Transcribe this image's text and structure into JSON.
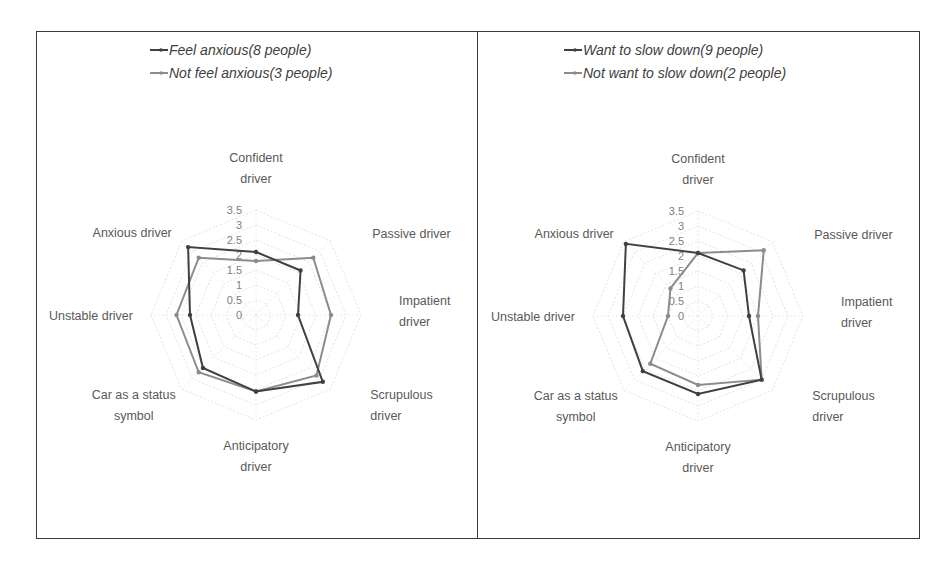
{
  "chart_data": [
    {
      "type": "radar",
      "title": "",
      "categories": [
        "Confident driver",
        "Passive driver",
        "Impatient driver",
        "Scrupulous driver",
        "Anticipatory driver",
        "Car as a status symbol",
        "Unstable driver",
        "Anxious driver"
      ],
      "category_lines": [
        [
          "Confident",
          "driver"
        ],
        [
          "Passive driver"
        ],
        [
          "Impatient",
          "driver"
        ],
        [
          "Scrupulous",
          "driver"
        ],
        [
          "Anticipatory",
          "driver"
        ],
        [
          "Car as a status",
          "symbol"
        ],
        [
          "Unstable driver"
        ],
        [
          "Anxious driver"
        ]
      ],
      "rlim": [
        0,
        3.5
      ],
      "ticks": [
        "0",
        "0.5",
        "1",
        "1.5",
        "2",
        "2.5",
        "3",
        "3.5"
      ],
      "grid": true,
      "legend_position": "top",
      "series": [
        {
          "name": "Feel anxious(8 people)",
          "color": "#404040",
          "values": [
            2.1,
            2.1,
            1.4,
            3.15,
            2.55,
            2.5,
            2.2,
            3.2
          ]
        },
        {
          "name": "Not feel anxious(3 people)",
          "color": "#8c8c8c",
          "values": [
            1.8,
            2.7,
            2.5,
            2.85,
            2.55,
            2.7,
            2.65,
            2.7
          ]
        }
      ]
    },
    {
      "type": "radar",
      "title": "",
      "categories": [
        "Confident driver",
        "Passive driver",
        "Impatient driver",
        "Scrupulous driver",
        "Anticipatory driver",
        "Car as a status symbol",
        "Unstable driver",
        "Anxious driver"
      ],
      "category_lines": [
        [
          "Confident",
          "driver"
        ],
        [
          "Passive driver"
        ],
        [
          "Impatient",
          "driver"
        ],
        [
          "Scrupulous",
          "driver"
        ],
        [
          "Anticipatory",
          "driver"
        ],
        [
          "Car as a status",
          "symbol"
        ],
        [
          "Unstable driver"
        ],
        [
          "Anxious driver"
        ]
      ],
      "rlim": [
        0,
        3.5
      ],
      "ticks": [
        "0",
        "0.5",
        "1",
        "1.5",
        "2",
        "2.5",
        "3",
        "3.5"
      ],
      "grid": true,
      "legend_position": "top",
      "series": [
        {
          "name": "Want to slow down(9 people)",
          "color": "#404040",
          "values": [
            2.1,
            2.15,
            1.7,
            3.0,
            2.6,
            2.6,
            2.5,
            3.4
          ]
        },
        {
          "name": "Not want to slow down(2 people)",
          "color": "#8c8c8c",
          "values": [
            2.1,
            3.1,
            2.0,
            3.0,
            2.3,
            2.25,
            1.0,
            1.3
          ]
        }
      ]
    }
  ],
  "panels": [
    {
      "legend": [
        "Feel anxious(8 people)",
        "Not feel anxious(3 people)"
      ]
    },
    {
      "legend": [
        "Want to slow down(9 people)",
        "Not want to slow down(2 people)"
      ]
    }
  ]
}
